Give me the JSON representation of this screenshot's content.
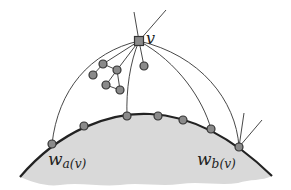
{
  "diagram": {
    "colors": {
      "region_fill": "#d9d9d9",
      "boundary_stroke": "#222222",
      "edge_stroke": "#333333",
      "node_fill": "#8a8a8a",
      "node_stroke": "#333333"
    },
    "labels": {
      "v": "v",
      "wa_main": "w",
      "wa_sub": "a(v)",
      "wb_main": "w",
      "wb_sub": "b(v)"
    },
    "vertex_v": {
      "shape": "square",
      "x": 139,
      "y": 41
    },
    "boundary_nodes": [
      {
        "id": "w_a",
        "x": 52,
        "y": 144
      },
      {
        "id": "n1",
        "x": 84,
        "y": 126
      },
      {
        "id": "n2",
        "x": 127,
        "y": 116
      },
      {
        "id": "n3",
        "x": 158,
        "y": 116
      },
      {
        "id": "n4",
        "x": 183,
        "y": 120
      },
      {
        "id": "n5",
        "x": 211,
        "y": 129
      },
      {
        "id": "w_b",
        "x": 239,
        "y": 147
      }
    ],
    "interior_nodes": [
      {
        "id": "i1",
        "x": 103,
        "y": 64
      },
      {
        "id": "i2",
        "x": 93,
        "y": 75
      },
      {
        "id": "i3",
        "x": 117,
        "y": 70
      },
      {
        "id": "i4",
        "x": 106,
        "y": 85
      },
      {
        "id": "i5",
        "x": 120,
        "y": 90
      },
      {
        "id": "i6",
        "x": 144,
        "y": 66
      }
    ]
  }
}
